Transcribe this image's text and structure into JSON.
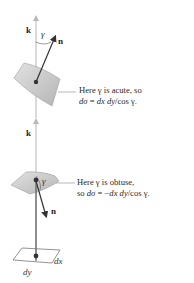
{
  "figure": {
    "upper": {
      "axis_label": "k",
      "normal_label": "n",
      "angle_label": "γ",
      "caption_line1": "Here γ is acute, so",
      "caption_line2_parts": [
        "dσ",
        " = ",
        "dx dy",
        "/cos γ."
      ]
    },
    "lower": {
      "axis_label": "k",
      "normal_label": "n",
      "angle_label": "γ",
      "caption_line1": "Here γ is obtuse,",
      "caption_line2_parts": [
        "so ",
        "dσ",
        " = −",
        "dx dy",
        "/cos γ."
      ]
    },
    "base": {
      "dx_label": "dx",
      "dy_label": "dy"
    },
    "colors": {
      "axis": "#b0b0b0",
      "arrow": "#333333",
      "surface_fill": "#c8c8c8",
      "surface_edge": "#9a9a9a",
      "leader": "#888888"
    }
  }
}
